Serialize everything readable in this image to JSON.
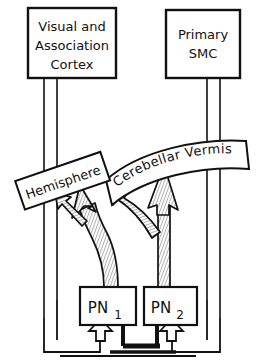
{
  "diagram": {
    "nodes": {
      "visual_cortex": {
        "label_line1": "Visual and",
        "label_line2": "Association",
        "label_line3": "Cortex",
        "shape": "rectangle"
      },
      "primary_smc": {
        "label_line1": "Primary",
        "label_line2": "SMC",
        "shape": "rectangle"
      },
      "hemisphere": {
        "label": "Hemisphere",
        "shape": "rotated-banner"
      },
      "cerebellar_vermis": {
        "label": "Cerebellar  Vermis",
        "shape": "curved-banner"
      },
      "pn1": {
        "label_main": "PN",
        "label_sub": "1",
        "shape": "rectangle"
      },
      "pn2": {
        "label_main": "PN",
        "label_sub": "2",
        "shape": "rectangle"
      }
    },
    "colors": {
      "stroke": "#111111",
      "fill": "#ffffff",
      "hatch": "#8c8c8c"
    },
    "edges": [
      {
        "name": "cortex-to-pn1-descending",
        "from": "visual_cortex",
        "to": "pn1",
        "style": "double-line"
      },
      {
        "name": "smc-to-pn2-descending",
        "from": "primary_smc",
        "to": "pn2",
        "style": "double-line"
      },
      {
        "name": "pn1-to-hemisphere",
        "from": "pn1",
        "to": "hemisphere",
        "style": "hatched-arrow"
      },
      {
        "name": "pn1-to-vermis-left",
        "from": "pn1",
        "to": "cerebellar_vermis",
        "style": "hatched-arrow"
      },
      {
        "name": "pn2-to-vermis",
        "from": "pn2",
        "to": "cerebellar_vermis",
        "style": "hatched-arrow"
      },
      {
        "name": "pn2-to-hemisphere",
        "from": "pn2",
        "to": "hemisphere",
        "style": "hatched-arrow"
      },
      {
        "name": "feedback-outer-left-to-pn1",
        "from": "visual_cortex",
        "to": "pn1",
        "style": "hollow-arrow"
      },
      {
        "name": "feedback-outer-right-to-pn2",
        "from": "primary_smc",
        "to": "pn2",
        "style": "hollow-arrow"
      },
      {
        "name": "feedback-inner-to-pn1",
        "from": "bottom-bus",
        "to": "pn1",
        "style": "solid-arrow"
      },
      {
        "name": "feedback-inner-to-pn2",
        "from": "bottom-bus",
        "to": "pn2",
        "style": "solid-arrow"
      }
    ]
  }
}
